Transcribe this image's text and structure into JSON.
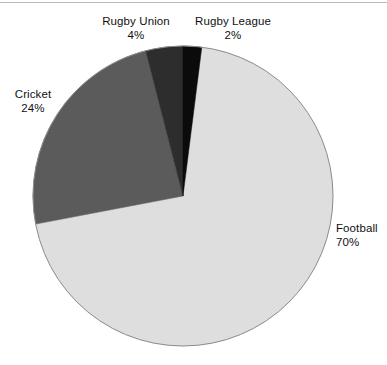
{
  "chart_data": {
    "type": "pie",
    "title": "",
    "subtitle": "",
    "xlabel": "",
    "ylabel": "",
    "legend_position": "none",
    "grid": false,
    "units": "percent",
    "total": 100,
    "start_angle_deg": 0,
    "direction": "clockwise",
    "categories": [
      "Rugby League",
      "Football",
      "Cricket",
      "Rugby Union"
    ],
    "values": [
      2,
      70,
      24,
      4
    ],
    "labels": [
      "2%",
      "70%",
      "24%",
      "4%"
    ],
    "colors": [
      "#0b0b0b",
      "#dedede",
      "#5b5b5b",
      "#2d2d2d"
    ],
    "slices": [
      {
        "name": "Rugby League",
        "value": 2,
        "value_label": "2%",
        "color": "#0b0b0b",
        "start_deg": 0,
        "sweep_deg": 7.2,
        "label_position": "top-right"
      },
      {
        "name": "Football",
        "value": 70,
        "value_label": "70%",
        "color": "#dedede",
        "start_deg": 7.2,
        "sweep_deg": 252,
        "label_position": "right"
      },
      {
        "name": "Cricket",
        "value": 24,
        "value_label": "24%",
        "color": "#5b5b5b",
        "start_deg": 259.2,
        "sweep_deg": 86.4,
        "label_position": "left"
      },
      {
        "name": "Rugby Union",
        "value": 4,
        "value_label": "4%",
        "color": "#2d2d2d",
        "start_deg": 345.6,
        "sweep_deg": 14.4,
        "label_position": "top-left"
      }
    ]
  },
  "labels": {
    "rugby_union": {
      "name": "Rugby Union",
      "pct": "4%"
    },
    "rugby_league": {
      "name": "Rugby League",
      "pct": "2%"
    },
    "cricket": {
      "name": "Cricket",
      "pct": "24%"
    },
    "football": {
      "name": "Football",
      "pct": "70%"
    }
  },
  "geometry": {
    "center_x": 183,
    "center_y": 196,
    "radius": 150,
    "outline_color": "#8c8c8c"
  }
}
